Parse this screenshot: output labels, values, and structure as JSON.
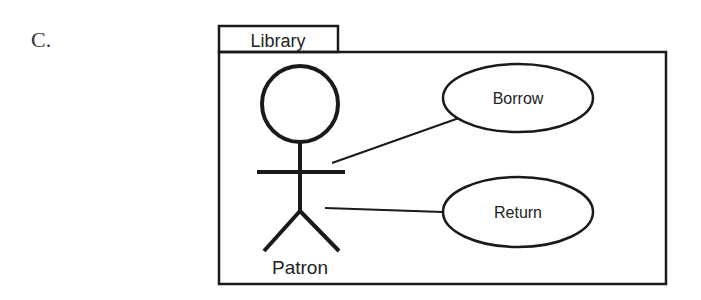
{
  "option_label": "C.",
  "system": {
    "name": "Library"
  },
  "actor": {
    "name": "Patron"
  },
  "use_cases": [
    {
      "label": "Borrow"
    },
    {
      "label": "Return"
    }
  ],
  "associations": [
    {
      "from": "Patron",
      "to": "Borrow"
    },
    {
      "from": "Patron",
      "to": "Return"
    }
  ],
  "colors": {
    "stroke": "#1a1a1a",
    "text": "#222222",
    "background": "#ffffff"
  }
}
